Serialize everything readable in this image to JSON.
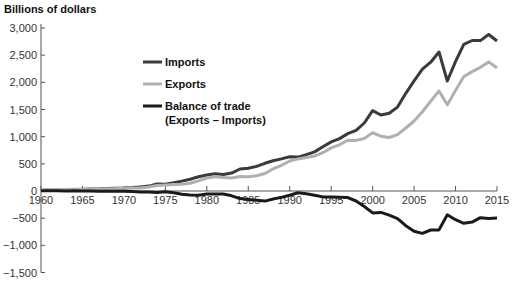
{
  "chart_data": {
    "type": "line",
    "title": "",
    "ylabel": "Billions of dollars",
    "xlabel": "",
    "ylim": [
      -1500,
      3000
    ],
    "xlim": [
      1960,
      2015
    ],
    "grid": false,
    "legend_position": "upper-left-inside",
    "yticks": [
      3000,
      2500,
      2000,
      1500,
      1000,
      500,
      0,
      -500,
      -1000,
      -1500
    ],
    "ytick_labels": [
      "3,000",
      "2,500",
      "2,000",
      "1,500",
      "1,000",
      "500",
      "0",
      "−500",
      "−1,000",
      "−1,500"
    ],
    "xticks": [
      1960,
      1965,
      1970,
      1975,
      1980,
      1985,
      1990,
      1995,
      2000,
      2005,
      2010,
      2015
    ],
    "xtick_labels": [
      "1960",
      "1965",
      "1970",
      "1975",
      "1980",
      "1985",
      "1990",
      "1995",
      "2000",
      "2005",
      "2010",
      "2015"
    ],
    "x": [
      1960,
      1961,
      1962,
      1963,
      1964,
      1965,
      1966,
      1967,
      1968,
      1969,
      1970,
      1971,
      1972,
      1973,
      1974,
      1975,
      1976,
      1977,
      1978,
      1979,
      1980,
      1981,
      1982,
      1983,
      1984,
      1985,
      1986,
      1987,
      1988,
      1989,
      1990,
      1991,
      1992,
      1993,
      1994,
      1995,
      1996,
      1997,
      1998,
      1999,
      2000,
      2001,
      2002,
      2003,
      2004,
      2005,
      2006,
      2007,
      2008,
      2009,
      2010,
      2011,
      2012,
      2013,
      2014,
      2015
    ],
    "series": [
      {
        "name": "Imports",
        "color": "#3a3a3a",
        "values": [
          23,
          23,
          25,
          27,
          29,
          32,
          38,
          41,
          47,
          51,
          56,
          62,
          75,
          91,
          128,
          123,
          151,
          183,
          218,
          263,
          294,
          318,
          303,
          329,
          405,
          417,
          453,
          509,
          555,
          591,
          630,
          624,
          668,
          720,
          813,
          903,
          965,
          1056,
          1116,
          1252,
          1478,
          1399,
          1430,
          1545,
          1798,
          2027,
          2241,
          2370,
          2559,
          2024,
          2380,
          2700,
          2770,
          2768,
          2880,
          2761
        ]
      },
      {
        "name": "Exports",
        "color": "#b0b0b0",
        "values": [
          26,
          27,
          28,
          29,
          32,
          33,
          36,
          38,
          41,
          45,
          51,
          53,
          57,
          75,
          101,
          109,
          118,
          124,
          142,
          185,
          240,
          262,
          247,
          241,
          265,
          261,
          281,
          323,
          407,
          473,
          552,
          591,
          617,
          643,
          704,
          794,
          851,
          935,
          932,
          966,
          1075,
          1006,
          985,
          1037,
          1160,
          1288,
          1460,
          1653,
          1843,
          1587,
          1852,
          2106,
          2198,
          2277,
          2376,
          2264
        ]
      },
      {
        "name": "Balance of trade (Exports − Imports)",
        "color": "#1a1a1a",
        "values": [
          3,
          4,
          3,
          2,
          3,
          1,
          -2,
          -3,
          -6,
          -6,
          -5,
          -9,
          -18,
          -16,
          -27,
          -14,
          -33,
          -59,
          -76,
          -78,
          -54,
          -56,
          -56,
          -88,
          -140,
          -156,
          -172,
          -186,
          -148,
          -118,
          -78,
          -33,
          -51,
          -77,
          -109,
          -109,
          -114,
          -121,
          -184,
          -286,
          -403,
          -393,
          -445,
          -508,
          -638,
          -739,
          -781,
          -717,
          -716,
          -437,
          -528,
          -594,
          -572,
          -491,
          -504,
          -497
        ]
      }
    ]
  },
  "legend": {
    "imports": "Imports",
    "exports": "Exports",
    "balance_line1": "Balance of trade",
    "balance_line2": "(Exports – Imports)"
  },
  "axis": {
    "ylabel": "Billions of dollars"
  }
}
